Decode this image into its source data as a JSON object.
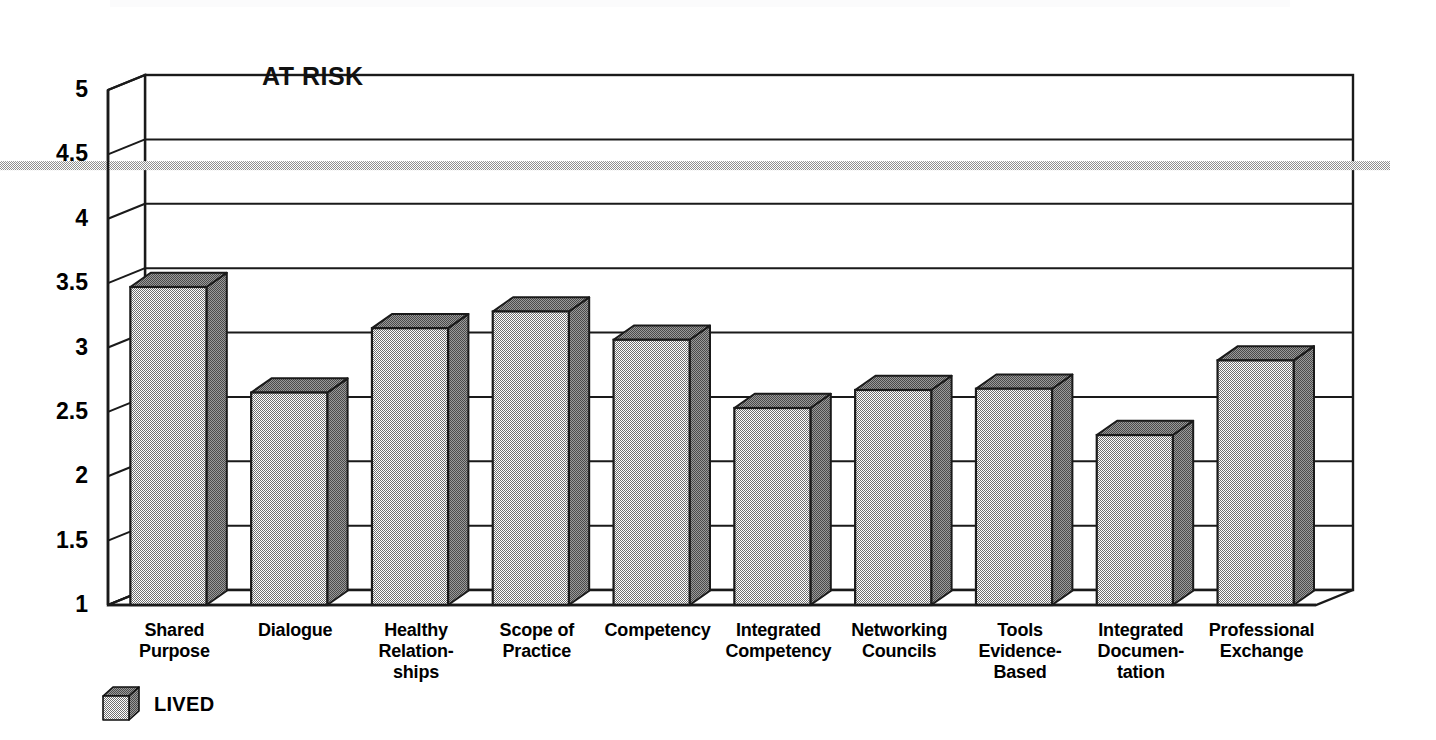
{
  "chart_data": {
    "type": "bar",
    "title": "",
    "annotation": "AT RISK",
    "xlabel": "",
    "ylabel": "",
    "ylim": [
      1,
      5
    ],
    "yticks": [
      "1",
      "1.5",
      "2",
      "2.5",
      "3",
      "3.5",
      "4",
      "4.5",
      "5"
    ],
    "grid": true,
    "legend_position": "bottom-left",
    "threshold_line": {
      "label": "AT RISK",
      "value": 4.3,
      "color": "#a8a8a8"
    },
    "categories": [
      "Shared\nPurpose",
      "Dialogue",
      "Healthy\nRelation-\nships",
      "Scope of\nPractice",
      "Competency",
      "Integrated\nCompetency",
      "Networking\nCouncils",
      "Tools\nEvidence-\nBased",
      "Integrated\nDocumen-\ntation",
      "Professional\nExchange"
    ],
    "series": [
      {
        "name": "LIVED",
        "values": [
          3.47,
          2.65,
          3.15,
          3.28,
          3.06,
          2.53,
          2.67,
          2.68,
          2.32,
          2.9
        ]
      }
    ]
  },
  "categories_lines": [
    [
      "Shared",
      "Purpose"
    ],
    [
      "Dialogue"
    ],
    [
      "Healthy",
      "Relation-",
      "ships"
    ],
    [
      "Scope of",
      "Practice"
    ],
    [
      "Competency"
    ],
    [
      "Integrated",
      "Competency"
    ],
    [
      "Networking",
      "Councils"
    ],
    [
      "Tools",
      "Evidence-",
      "Based"
    ],
    [
      "Integrated",
      "Documen-",
      "tation"
    ],
    [
      "Professional",
      "Exchange"
    ]
  ],
  "legend": {
    "icon": "cube-3d-icon",
    "label": "LIVED"
  },
  "colors": {
    "bar_front": "#adadad",
    "bar_side": "#8c8c8c",
    "bar_top": "#8c8c8c",
    "outline": "#1a1a1a",
    "threshold": "#a8a8a8",
    "text": "#000000",
    "background": "#ffffff"
  }
}
